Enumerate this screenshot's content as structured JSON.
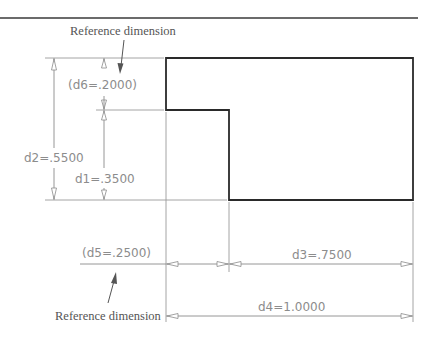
{
  "figure": {
    "notes": {
      "top": "Reference dimension",
      "bottom": "Reference dimension"
    },
    "dimensions": {
      "d1": "d1=.3500",
      "d2": "d2=.5500",
      "d3": "d3=.7500",
      "d4": "d4=1.0000",
      "d5": "(d5=.2500)",
      "d6": "(d6=.2000)"
    },
    "colors": {
      "outline": "#2a2a2a",
      "dimension": "#8a8a8a",
      "text": "#8c8c8c"
    }
  }
}
